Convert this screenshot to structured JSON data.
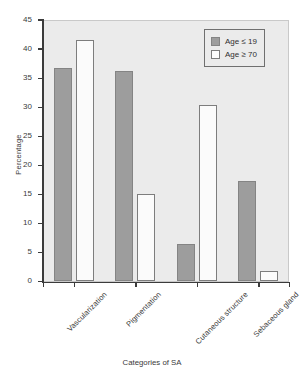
{
  "chart_data": {
    "type": "bar",
    "title": "",
    "xlabel": "Categories of SA",
    "ylabel": "Percentage",
    "categories": [
      "Vascularization",
      "Pigmentation",
      "Cutaneous structure",
      "Sebaceous gland"
    ],
    "series": [
      {
        "name": "Age ≤ 19",
        "style": "filled",
        "values": [
          36.7,
          36.2,
          6.4,
          17.3
        ]
      },
      {
        "name": "Age ≥ 70",
        "style": "hollow",
        "values": [
          41.5,
          15.1,
          30.4,
          1.8
        ]
      }
    ],
    "ylim": [
      0,
      45
    ],
    "yticks": [
      0,
      5,
      10,
      15,
      20,
      25,
      30,
      35,
      40,
      45
    ],
    "ytick_labels": [
      "0",
      "5",
      "10",
      "15",
      "20",
      "25",
      "30",
      "35",
      "40",
      "45"
    ],
    "grid": false,
    "legend_position": "top-right"
  },
  "legend": {
    "entries": [
      {
        "label": "Age ≤ 19",
        "swatch": "filled"
      },
      {
        "label": "Age ≥ 70",
        "swatch": "hollow"
      }
    ]
  },
  "colors": {
    "bar_filled": "#9d9d9d",
    "bar_hollow": "#fbfbfb",
    "panel_background": "#ebebeb",
    "axis": "#3b3b3b",
    "text": "#3a3a3a"
  }
}
